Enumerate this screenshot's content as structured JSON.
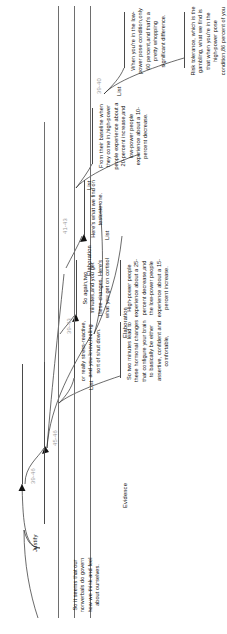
{
  "diagram": {
    "type": "rst-discourse-tree",
    "orientation": "rotated-90-ccw",
    "root_span": "39-46",
    "relations": {
      "justify": "Justify",
      "evidence": "Evidence",
      "elaboration_a": "Elaboration",
      "elaboration_b": "Elaboration",
      "list_a": "List",
      "list_b": "List",
      "list_c": "List",
      "list_d": "List"
    },
    "spans": {
      "s39_46": "39-46",
      "s45_46": "45-46",
      "s39_43": "39-43",
      "s41_43": "41-43",
      "s39_40": "39-40"
    },
    "edus": {
      "e39": "Risk tolerance, which is the gambling, what we find is that when you're in the high-power pose condition,86 percent of you will gamble.",
      "e40": "When you're in the low-power pose condition,only 60 percent,and that's a pretty whopping significant difference.",
      "e41": "Here's what we find on testosterone.",
      "e42": "From their baseline when they come in,high-power people experience about a 20-percent increase,and low-power people experience about a 10-percent decrease.",
      "e43": "So again,two minutes,and you get these changes. Here's what you get on cortisol",
      "e44": "High-power people experience about a 25-percent decrease,and the low-power people experience about a 15-percent increase.",
      "e45": "So two minutes lead to these hormonal changes that configure your brain to basically be either assertive, confident and comfortable,",
      "e46": "or really stress-reactive, and you know,feeling sort of shut down.",
      "e_root": "So it seems that our nonverbals do govern how we think and feel about ourselves."
    }
  }
}
